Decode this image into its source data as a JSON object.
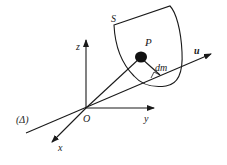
{
  "diagram": {
    "labels": {
      "surface": "S",
      "point": "P",
      "mass_element": "dm",
      "z_axis": "z",
      "y_axis": "y",
      "x_axis": "x",
      "origin": "O",
      "axis_line": "(Δ)",
      "direction": "u"
    },
    "colors": {
      "stroke": "#1a1a1a",
      "background": "#ffffff"
    }
  }
}
